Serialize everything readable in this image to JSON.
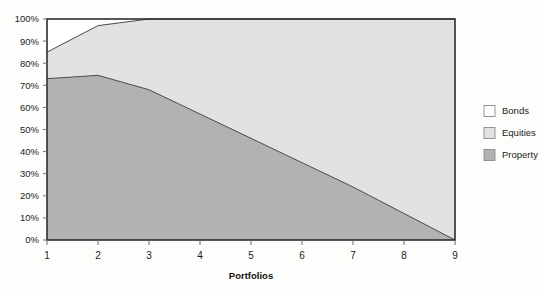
{
  "chart_data": {
    "type": "area",
    "stacked": true,
    "title": "",
    "subtitle": "",
    "xlabel": "Portfolios",
    "ylabel": "",
    "x": [
      1,
      2,
      3,
      4,
      5,
      6,
      7,
      8,
      9
    ],
    "categories": [
      "1",
      "2",
      "3",
      "4",
      "5",
      "6",
      "7",
      "8",
      "9"
    ],
    "xlim": [
      1,
      9
    ],
    "ylim": [
      0,
      100
    ],
    "grid": false,
    "legend_position": "right",
    "x_tick_labels": [
      "1",
      "2",
      "3",
      "4",
      "5",
      "6",
      "7",
      "8",
      "9"
    ],
    "y_tick_labels": [
      "0%",
      "10%",
      "20%",
      "30%",
      "40%",
      "50%",
      "60%",
      "70%",
      "80%",
      "90%",
      "100%"
    ],
    "y_tick_values": [
      0,
      10,
      20,
      30,
      40,
      50,
      60,
      70,
      80,
      90,
      100
    ],
    "series": [
      {
        "name": "Property",
        "color": "#b2b2b2",
        "values": [
          73,
          74.5,
          68,
          57,
          46,
          35,
          24,
          12,
          0
        ],
        "cumulative_top": [
          73,
          74.5,
          68,
          57,
          46,
          35,
          24,
          12,
          0
        ]
      },
      {
        "name": "Equities",
        "color": "#e2e2e0",
        "values": [
          12,
          22.5,
          32,
          43,
          54,
          65,
          76,
          88,
          100
        ],
        "cumulative_top": [
          85,
          97,
          100,
          100,
          100,
          100,
          100,
          100,
          100
        ]
      },
      {
        "name": "Bonds",
        "color": "#ffffff",
        "values": [
          15,
          3,
          0,
          0,
          0,
          0,
          0,
          0,
          0
        ],
        "cumulative_top": [
          100,
          100,
          100,
          100,
          100,
          100,
          100,
          100,
          100
        ]
      }
    ],
    "annotations": []
  },
  "legend": {
    "items": [
      {
        "label": "Bonds",
        "color": "#ffffff"
      },
      {
        "label": "Equities",
        "color": "#e2e2e0"
      },
      {
        "label": "Property",
        "color": "#b2b2b2"
      }
    ]
  },
  "axes": {
    "x_title": "Portfolios"
  },
  "colors": {
    "bonds": "#ffffff",
    "equities": "#e2e2e0",
    "property": "#b2b2b2",
    "frame": "#2e2e2e",
    "text": "#1c1c1c",
    "page_background": "#fdfdfb"
  }
}
